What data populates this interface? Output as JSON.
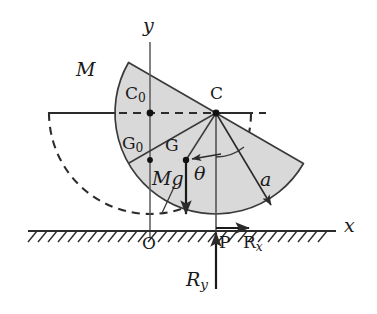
{
  "figure": {
    "background": "#ffffff",
    "stroke_color": "#2b2b2b",
    "fill_color": "#d9d9d9",
    "width": 377,
    "height": 314
  },
  "axes": {
    "x_label": "x",
    "y_label": "y",
    "origin_label": "O",
    "x_line": {
      "x1": 28,
      "y1": 231,
      "x2": 336,
      "y2": 231
    },
    "y_line": {
      "x1": 150,
      "y1": 42,
      "x2": 150,
      "y2": 238
    },
    "x_label_pos": {
      "x": 344,
      "y": 218
    },
    "y_label_pos": {
      "x": 143,
      "y": 18
    },
    "origin_pos": {
      "x": 143,
      "y": 236
    }
  },
  "ground": {
    "name": "hatched-ground",
    "line_y": 231,
    "x_start": 28,
    "x_end": 336,
    "hatch_count": 30,
    "hatch_length": 11,
    "hatch_angle_deg": 50
  },
  "body": {
    "name": "half-disc",
    "mass_label": "M",
    "mass_label_pos": {
      "x": 79,
      "y": 70
    },
    "center": {
      "x": 216,
      "y": 113
    },
    "radius": 101,
    "rotation_deg": 30,
    "contact_point": {
      "x": 216,
      "y": 231
    }
  },
  "ghost": {
    "name": "initial-position-outline",
    "center": {
      "x": 150,
      "y": 113
    },
    "radius": 101,
    "style": "dashed"
  },
  "points": [
    {
      "id": "C0",
      "label": "C",
      "sub": "0",
      "x": 150,
      "y": 113,
      "label_x": 126,
      "label_y": 88
    },
    {
      "id": "C",
      "label": "C",
      "sub": "",
      "x": 216,
      "y": 113,
      "label_x": 210,
      "label_y": 88
    },
    {
      "id": "G0",
      "label": "G",
      "sub": "0",
      "x": 150,
      "y": 160,
      "label_x": 122,
      "label_y": 137
    },
    {
      "id": "G",
      "label": "G",
      "sub": "",
      "x": 186,
      "y": 160,
      "label_x": 166,
      "label_y": 139
    },
    {
      "id": "P",
      "label": "P",
      "sub": "",
      "x": 216,
      "y": 231,
      "label_x": 219,
      "label_y": 236
    }
  ],
  "vectors": {
    "weight": {
      "name": "weight-vector",
      "label": "Mg",
      "label_pos": {
        "x": 155,
        "y": 175
      },
      "from": {
        "x": 186,
        "y": 160
      },
      "to": {
        "x": 186,
        "y": 215
      }
    },
    "reaction_x": {
      "name": "friction-reaction-vector",
      "label": "R",
      "sub": "x",
      "label_pos": {
        "x": 243,
        "y": 236
      },
      "from": {
        "x": 216,
        "y": 228
      },
      "to": {
        "x": 250,
        "y": 228
      }
    },
    "reaction_y": {
      "name": "normal-reaction-vector",
      "label": "R",
      "sub": "y",
      "label_pos": {
        "x": 188,
        "y": 274
      },
      "from": {
        "x": 216,
        "y": 288
      },
      "to": {
        "x": 216,
        "y": 232
      }
    },
    "radius_a": {
      "name": "radius-vector",
      "label": "a",
      "label_pos": {
        "x": 262,
        "y": 175
      },
      "from": {
        "x": 216,
        "y": 113
      },
      "to": {
        "x": 272,
        "y": 206
      }
    },
    "cg_arrow": {
      "name": "cg-direction-arrow",
      "from": {
        "x": 216,
        "y": 155
      },
      "to": {
        "x": 190,
        "y": 159
      }
    }
  },
  "angle": {
    "name": "theta-angle",
    "label": "θ",
    "label_pos": {
      "x": 196,
      "y": 168
    },
    "vertex": {
      "x": 216,
      "y": 113
    },
    "arc_radius": 44
  }
}
